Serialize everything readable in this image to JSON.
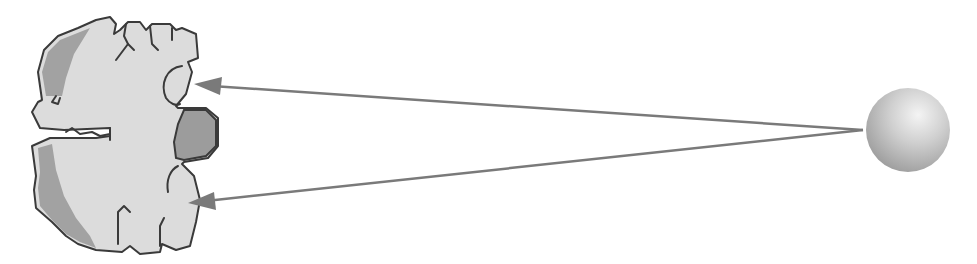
{
  "diagram": {
    "type": "illustration",
    "colors": {
      "background": "#ffffff",
      "brain_fill": "#dcdcdc",
      "brain_outline": "#3a3a3a",
      "shaded_region": "#9e9e9e",
      "arrow": "#7a7a7a",
      "sphere_light": "#f2f2f2",
      "sphere_dark": "#9a9a9a"
    },
    "elements": {
      "brain_section": {
        "label": ""
      },
      "sphere": {
        "label": "",
        "cx": 908,
        "cy": 130,
        "r": 42
      },
      "arrows": [
        {
          "from": [
            863,
            130
          ],
          "to": [
            194,
            84
          ]
        },
        {
          "from": [
            863,
            130
          ],
          "to": [
            188,
            203
          ]
        }
      ]
    }
  }
}
